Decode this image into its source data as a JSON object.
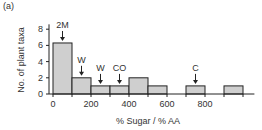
{
  "panel_label": "(a)",
  "chart_data": {
    "type": "bar",
    "title": "",
    "xlabel": "% Sugar / % AA",
    "ylabel": "No. of plant taxa",
    "bin_width": 100,
    "bins": [
      {
        "start": 0,
        "end": 100,
        "count": 6.3
      },
      {
        "start": 100,
        "end": 200,
        "count": 2
      },
      {
        "start": 200,
        "end": 300,
        "count": 1
      },
      {
        "start": 300,
        "end": 400,
        "count": 1
      },
      {
        "start": 400,
        "end": 500,
        "count": 2
      },
      {
        "start": 500,
        "end": 600,
        "count": 1
      },
      {
        "start": 600,
        "end": 700,
        "count": 0
      },
      {
        "start": 700,
        "end": 800,
        "count": 1
      },
      {
        "start": 800,
        "end": 900,
        "count": 0
      },
      {
        "start": 900,
        "end": 1000,
        "count": 1
      }
    ],
    "xticks": [
      0,
      200,
      400,
      600,
      800
    ],
    "yticks": [
      0,
      2,
      4,
      6,
      8
    ],
    "xlim": [
      0,
      1050
    ],
    "ylim": [
      0,
      8.5
    ],
    "annotations": [
      {
        "label": "2M",
        "x": 50,
        "y": 6.3
      },
      {
        "label": "W",
        "x": 150,
        "y": 2
      },
      {
        "label": "W",
        "x": 250,
        "y": 1
      },
      {
        "label": "CO",
        "x": 350,
        "y": 1
      },
      {
        "label": "C",
        "x": 750,
        "y": 1
      }
    ],
    "bar_color": "#cfcfcf",
    "edge_color": "#222222",
    "grid": false,
    "legend": null
  }
}
